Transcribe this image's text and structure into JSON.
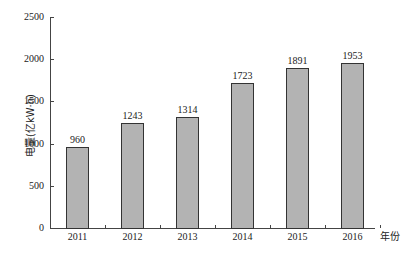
{
  "chart_data": {
    "type": "bar",
    "title": "",
    "xlabel": "年份",
    "ylabel": "电量(亿kW·h)",
    "categories": [
      "2011",
      "2012",
      "2013",
      "2014",
      "2015",
      "2016"
    ],
    "values": [
      960,
      1243,
      1314,
      1723,
      1891,
      1953
    ],
    "ylim": [
      0,
      2500
    ],
    "yticks": [
      0,
      500,
      1000,
      1500,
      2000,
      2500
    ],
    "grid": false,
    "legend": null,
    "bar_color": "#b3b3b3",
    "bar_border_color": "#333333",
    "data_labels": [
      "960",
      "1243",
      "1314",
      "1723",
      "1891",
      "1953"
    ]
  }
}
